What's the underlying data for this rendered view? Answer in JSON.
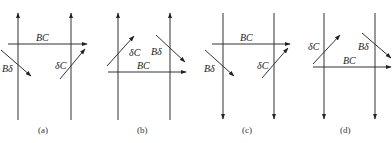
{
  "figure": {
    "panels": [
      {
        "id": "a",
        "caption": "(a)",
        "verticals": {
          "direction": "up",
          "x": [
            18,
            71
          ]
        },
        "vectors": {
          "BC": {
            "label": "BC",
            "from": [
              8,
              44
            ],
            "to": [
              87,
              44
            ]
          },
          "Bd": {
            "label": "Bδ",
            "from": [
              1,
              50
            ],
            "to": [
              31,
              76
            ]
          },
          "dC": {
            "label": "δC",
            "from": [
              60,
              79
            ],
            "to": [
              85,
              49
            ]
          }
        }
      },
      {
        "id": "b",
        "caption": "(b)",
        "verticals": {
          "direction": "up",
          "x": [
            118,
            170
          ]
        },
        "vectors": {
          "BC": {
            "label": "BC",
            "from": [
              108,
              72
            ],
            "to": [
              186,
              72
            ]
          },
          "Bd": {
            "label": "Bδ",
            "from": [
              156,
              35
            ],
            "to": [
              185,
              62
            ]
          },
          "dC": {
            "label": "δC",
            "from": [
              107,
              66
            ],
            "to": [
              134,
              36
            ]
          }
        }
      },
      {
        "id": "c",
        "caption": "(c)",
        "verticals": {
          "direction": "down",
          "x": [
            223,
            274
          ]
        },
        "vectors": {
          "BC": {
            "label": "BC",
            "from": [
              212,
              44
            ],
            "to": [
              290,
              44
            ]
          },
          "Bd": {
            "label": "Bδ",
            "from": [
              205,
              50
            ],
            "to": [
              234,
              76
            ]
          },
          "dC": {
            "label": "δC",
            "from": [
              262,
              78
            ],
            "to": [
              288,
              48
            ]
          }
        }
      },
      {
        "id": "d",
        "caption": "(d)",
        "verticals": {
          "direction": "down",
          "x": [
            324,
            375
          ]
        },
        "vectors": {
          "BC": {
            "label": "BC",
            "from": [
              313,
              67
            ],
            "to": [
              391,
              67
            ]
          },
          "Bd": {
            "label": "Bδ",
            "from": [
              362,
              33
            ],
            "to": [
              391,
              58
            ]
          },
          "dC": {
            "label": "δC",
            "from": [
              313,
              64
            ],
            "to": [
              340,
              35
            ]
          }
        }
      }
    ]
  }
}
